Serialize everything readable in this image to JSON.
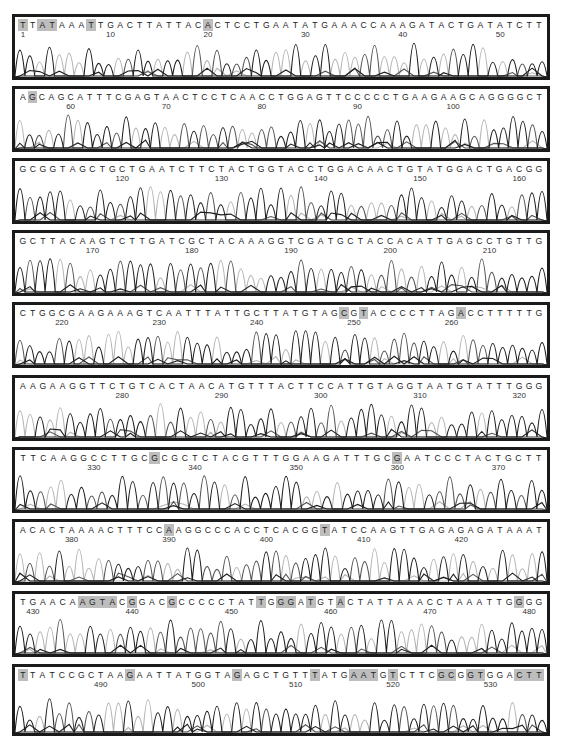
{
  "chart_data": {
    "type": "chromatogram",
    "title": "",
    "rows": [
      {
        "seq": "TTATAAATTGACTTATTACACTCCTGAATATGAAACCAAAGATACTGATATCTT",
        "start": 1,
        "ticks": [
          1,
          10,
          20,
          30,
          40,
          50
        ],
        "highlight": [
          0,
          2,
          3,
          7,
          19
        ]
      },
      {
        "seq": "AGCAGCATTTCGAGTAACTCCTCAACCTGGAGTTCCCCCTGAAGAAGCAGGGGCT",
        "start": 55,
        "ticks": [
          60,
          70,
          80,
          90,
          100
        ],
        "highlight": [
          1
        ]
      },
      {
        "seq": "GCGGTAGCTGCTGAATCTTCTACTGGTACCTGGACAACTGTATGGACTGACGG",
        "start": 110,
        "ticks": [
          120,
          130,
          140,
          150,
          160
        ],
        "highlight": []
      },
      {
        "seq": "GCTTACAAGTCTTGATCGCTACAAAGGTCGATGCTACCACATTGAGCCTGTTG",
        "start": 163,
        "ticks": [
          170,
          180,
          190,
          200,
          210
        ],
        "highlight": []
      },
      {
        "seq": "CTGGCGAAGAAAGTCAATTTATTGCTTATGTAGCGTACCCCTTAGACCTTTTTG",
        "start": 216,
        "ticks": [
          220,
          230,
          240,
          250,
          260
        ],
        "highlight": [
          33,
          35,
          45
        ]
      },
      {
        "seq": "AAGAAGGTTCTGTCACTAACATGTTTACTTCCATTGTAGGTAATGTATTTGGG",
        "start": 270,
        "ticks": [
          280,
          290,
          300,
          310,
          320
        ],
        "highlight": []
      },
      {
        "seq": "TTCAAGGCCTTGCGCGCTCTACGTTTGGAAGATTTGCGAATCCCTACTGCTT",
        "start": 323,
        "ticks": [
          330,
          340,
          350,
          360,
          370
        ],
        "highlight": [
          13,
          37
        ]
      },
      {
        "seq": "ACACTAAAACTTTCCAAGGCCCACCTCACGGTATCCAAGTTGAGAGAGATAAAT",
        "start": 375,
        "ticks": [
          380,
          390,
          400,
          410,
          420
        ],
        "highlight": [
          15,
          31
        ]
      },
      {
        "seq": "TGAACAAGTACGGACGCCCCCTATTGGGATGTACTATTAAACCTAAATTGGGG",
        "start": 429,
        "ticks": [
          430,
          440,
          450,
          460,
          470,
          480
        ],
        "highlight": [
          6,
          7,
          8,
          9,
          11,
          15,
          24,
          26,
          27,
          29,
          32,
          50
        ]
      },
      {
        "seq": "TTATCCGCTAAGAATTATGGTAGAGCTGTTTATGAATGTCTTCGCGGTGGACTT",
        "start": 482,
        "ticks": [
          490,
          500,
          510,
          520,
          530
        ],
        "highlight": [
          0,
          11,
          22,
          30,
          34,
          35,
          36,
          38,
          43,
          44,
          46,
          47,
          51,
          52,
          53
        ]
      }
    ],
    "legend": [],
    "xlabel": "base position",
    "ylabel": "signal intensity"
  },
  "colors": {
    "dark_trace": "#1f1f1f",
    "mid_trace": "#555555",
    "light_trace": "#b5b5b5",
    "highlight": "#bdbdbd",
    "border": "#1a1a1a"
  }
}
